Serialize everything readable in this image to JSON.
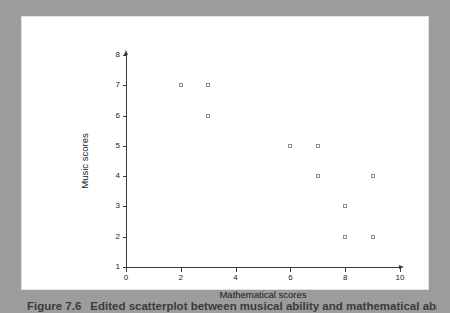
{
  "caption": {
    "number": "Figure 7.6",
    "text": "Edited scatterplot between musical ability and mathematical ability"
  },
  "chart_data": {
    "type": "scatter",
    "title": "",
    "xlabel": "Mathematical scores",
    "ylabel": "Music scores",
    "xlim": [
      0,
      10
    ],
    "ylim": [
      1,
      8
    ],
    "xticks": [
      0,
      2,
      4,
      6,
      8,
      10
    ],
    "yticks": [
      1,
      2,
      3,
      4,
      5,
      6,
      7,
      8
    ],
    "xticklabels": [
      "0",
      "2",
      "4",
      "6",
      "8",
      "10"
    ],
    "yticklabels": [
      "1",
      "2",
      "3",
      "4",
      "5",
      "6",
      "7",
      "8"
    ],
    "grid": false,
    "legend": false,
    "marker": "open-square",
    "marker_color": "#8e8e8e",
    "axis_color": "#3a3a3a",
    "points": [
      {
        "x": 2,
        "y": 7
      },
      {
        "x": 3,
        "y": 7
      },
      {
        "x": 3,
        "y": 6
      },
      {
        "x": 6,
        "y": 5
      },
      {
        "x": 7,
        "y": 5
      },
      {
        "x": 7,
        "y": 4
      },
      {
        "x": 9,
        "y": 4
      },
      {
        "x": 8,
        "y": 3
      },
      {
        "x": 8,
        "y": 2
      },
      {
        "x": 9,
        "y": 2
      }
    ]
  },
  "colors": {
    "frame": "#9c9c9c",
    "card": "#ffffff",
    "axis": "#3a3a3a",
    "marker": "#8e8e8e",
    "caption": "#3b3b3b"
  }
}
